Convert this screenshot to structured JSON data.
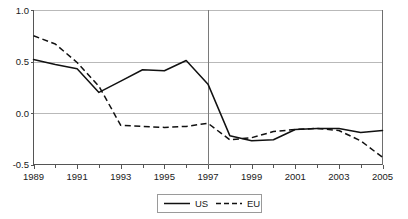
{
  "chart_data": {
    "type": "line",
    "title": "",
    "xlabel": "",
    "ylabel": "",
    "xlim": [
      1989,
      2005
    ],
    "ylim": [
      -0.5,
      1.0
    ],
    "grid": true,
    "legend_position": "bottom-center",
    "x": [
      1989,
      1990,
      1991,
      1992,
      1993,
      1994,
      1995,
      1996,
      1997,
      1998,
      1999,
      2000,
      2001,
      2002,
      2003,
      2004,
      2005
    ],
    "x_tick_labels": [
      "1989",
      "1991",
      "1993",
      "1995",
      "1997",
      "1999",
      "2001",
      "2003",
      "2005"
    ],
    "x_tick_values": [
      1989,
      1991,
      1993,
      1995,
      1997,
      1999,
      2001,
      2003,
      2005
    ],
    "x_minor_tick_values": [
      1990,
      1992,
      1994,
      1996,
      1998,
      2000,
      2002,
      2004
    ],
    "y_tick_labels": [
      "1.0",
      "0.5",
      "0.0",
      "-0.5"
    ],
    "y_tick_values": [
      1.0,
      0.5,
      0.0,
      -0.5
    ],
    "annotations": [
      {
        "type": "vertical-line",
        "x": 1997,
        "label": ""
      }
    ],
    "series": [
      {
        "name": "US",
        "style": "solid",
        "color": "#111111",
        "values": [
          0.52,
          0.47,
          0.43,
          0.2,
          0.31,
          0.42,
          0.41,
          0.51,
          0.28,
          -0.22,
          -0.27,
          -0.26,
          -0.16,
          -0.15,
          -0.15,
          -0.19,
          -0.17
        ]
      },
      {
        "name": "EU",
        "style": "dashed",
        "color": "#111111",
        "values": [
          0.75,
          0.67,
          0.49,
          0.26,
          -0.12,
          -0.13,
          -0.14,
          -0.13,
          -0.1,
          -0.26,
          -0.24,
          -0.18,
          -0.16,
          -0.15,
          -0.17,
          -0.27,
          -0.43
        ]
      }
    ]
  },
  "legend": {
    "items": [
      {
        "label": "US",
        "style": "solid"
      },
      {
        "label": "EU",
        "style": "dashed"
      }
    ]
  }
}
